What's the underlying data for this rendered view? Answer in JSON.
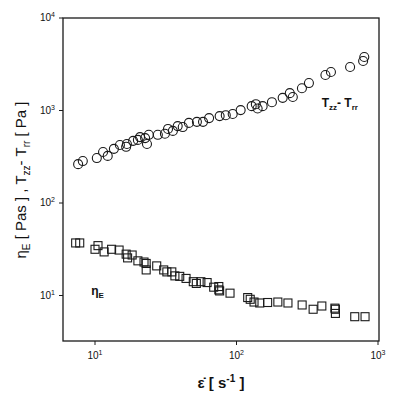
{
  "chart_data": {
    "type": "scatter",
    "title": "",
    "xlabel": "ε̇ [ s⁻¹ ]",
    "ylabel": "ηE [ Pas ] , Tzz - Trr [ Pa ]",
    "xscale": "log",
    "yscale": "log",
    "xlim": [
      6,
      1000
    ],
    "ylim": [
      3.2,
      10000
    ],
    "grid": false,
    "legend_position": "inline annotations",
    "x_ticks": [
      {
        "value": 10,
        "label": "10",
        "exp": "1"
      },
      {
        "value": 100,
        "label": "10",
        "exp": "2"
      },
      {
        "value": 1000,
        "label": "10",
        "exp": "3"
      }
    ],
    "y_ticks": [
      {
        "value": 10,
        "label": "10",
        "exp": "1"
      },
      {
        "value": 100,
        "label": "10",
        "exp": "2"
      },
      {
        "value": 1000,
        "label": "10",
        "exp": "3"
      },
      {
        "value": 10000,
        "label": "10",
        "exp": "4"
      }
    ],
    "series": [
      {
        "name": "Tzz - Trr",
        "marker": "circle",
        "annotation": {
          "text": "T",
          "sub1": "zz",
          "mid": "- T",
          "sub2": "rr",
          "x": 400,
          "y": 1080
        },
        "x": [
          7.6,
          8.2,
          10.3,
          11.4,
          12.3,
          13.6,
          15.0,
          16.6,
          16.8,
          18.6,
          20.1,
          20.8,
          22.6,
          23.3,
          24.0,
          27.8,
          31.2,
          32.8,
          35.5,
          38.4,
          41.7,
          46.1,
          52.5,
          58,
          64,
          76,
          84,
          94,
          107,
          128,
          137,
          141,
          153,
          178,
          212,
          238,
          250,
          290,
          325,
          425,
          465,
          635,
          785,
          800
        ],
        "y": [
          263,
          284,
          306,
          356,
          323,
          385,
          424,
          405,
          434,
          470,
          481,
          516,
          503,
          434,
          546,
          546,
          560,
          632,
          602,
          678,
          662,
          734,
          754,
          754,
          828,
          870,
          890,
          916,
          1010,
          1115,
          1170,
          1050,
          1115,
          1230,
          1370,
          1540,
          1400,
          1740,
          1980,
          2420,
          2610,
          2950,
          3430,
          3790
        ]
      },
      {
        "name": "ηE",
        "marker": "square",
        "annotation": {
          "text": "η",
          "sub1": "E",
          "mid": "",
          "sub2": "",
          "x": 9.4,
          "y": 10.2
        },
        "x": [
          7.3,
          7.8,
          10,
          10.5,
          11.6,
          13.1,
          14.8,
          16.6,
          17,
          18.3,
          20.1,
          22.2,
          23,
          23,
          27.3,
          30.6,
          32.2,
          34.9,
          36.7,
          39.7,
          44,
          49.5,
          52,
          56,
          62,
          69,
          75,
          75,
          76,
          90,
          120,
          125,
          133,
          146,
          166,
          196,
          231,
          291,
          348,
          401,
          496,
          500,
          500,
          685,
          810
        ],
        "y": [
          37,
          37,
          31.6,
          34.6,
          29.6,
          31.6,
          31,
          28,
          25.5,
          27.4,
          23.7,
          23,
          22.2,
          18.9,
          20.9,
          18.9,
          18,
          18,
          16.3,
          16.1,
          15.3,
          14.1,
          13.5,
          14.1,
          13.8,
          12.3,
          11.5,
          12.5,
          11.2,
          10.6,
          9.5,
          9.1,
          8.5,
          8.3,
          8.4,
          8.5,
          8.3,
          7.9,
          7.1,
          7.7,
          7.3,
          6.4,
          7.1,
          5.9,
          5.9
        ]
      }
    ]
  },
  "plot": {
    "frame": {
      "left": 63,
      "top": 18,
      "right": 379,
      "bottom": 341
    },
    "x_decade_px": 141.5,
    "x_ref_px": 95,
    "x_ref_log": 1,
    "y_decade_px": 92.5,
    "y_ref_px": 18,
    "y_ref_log": 4,
    "stroke_color": "#1a1a1a",
    "marker_size": 8
  },
  "labels": {
    "xlabel_main": "ε̇ [ s",
    "xlabel_sup": "-1",
    "xlabel_end": " ]",
    "ylabel_text": "η",
    "ylabel_sub_E": "E",
    "ylabel_mid": " [ Pas ] , T",
    "ylabel_sub_zz": "zz",
    "ylabel_mid2": "- T",
    "ylabel_sub_rr": "rr",
    "ylabel_end": " [ Pa ]"
  }
}
